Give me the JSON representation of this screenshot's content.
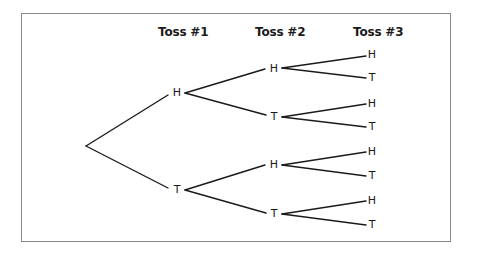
{
  "diagram": {
    "type": "probability-tree",
    "headers": [
      "Toss #1",
      "Toss #2",
      "Toss #3"
    ],
    "root": {
      "x": 86,
      "y": 146
    },
    "level1": [
      {
        "label": "H",
        "x": 177,
        "y": 93
      },
      {
        "label": "T",
        "x": 177,
        "y": 190
      }
    ],
    "level2": [
      {
        "label": "H",
        "x": 274,
        "y": 69
      },
      {
        "label": "T",
        "x": 274,
        "y": 117
      },
      {
        "label": "H",
        "x": 274,
        "y": 165
      },
      {
        "label": "T",
        "x": 274,
        "y": 214
      }
    ],
    "level3": [
      {
        "label": "H",
        "x": 372,
        "y": 55
      },
      {
        "label": "T",
        "x": 372,
        "y": 78
      },
      {
        "label": "H",
        "x": 372,
        "y": 104
      },
      {
        "label": "T",
        "x": 372,
        "y": 127
      },
      {
        "label": "H",
        "x": 372,
        "y": 152
      },
      {
        "label": "T",
        "x": 372,
        "y": 176
      },
      {
        "label": "H",
        "x": 372,
        "y": 201
      },
      {
        "label": "T",
        "x": 372,
        "y": 225
      }
    ],
    "line_color": "#1a1a1a",
    "border_color": "#8a8a8a"
  }
}
